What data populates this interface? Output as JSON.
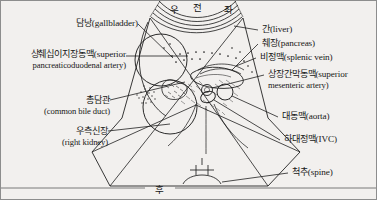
{
  "figure": {
    "background_color": "#f2f0ee",
    "line_color": "#1f1f1f"
  },
  "orientation": {
    "right": "우",
    "anterior": "전",
    "left": "좌",
    "posterior": "후"
  },
  "labels_left": [
    {
      "id": "gallbladder",
      "ko": "담낭(gallbladder)",
      "en": "",
      "lines": 1
    },
    {
      "id": "superior-pancreaticoduodenal-artery",
      "ko": "상췌십이지장동맥(superior",
      "en": "pancreaticoduodenal artery)",
      "lines": 2
    },
    {
      "id": "common-bile-duct",
      "ko": "총담관",
      "en": "(common bile duct)",
      "lines": 2
    },
    {
      "id": "right-kidney",
      "ko": "우측신장",
      "en": "(right kidney)",
      "lines": 2
    }
  ],
  "labels_right": [
    {
      "id": "liver",
      "ko": "간(liver)",
      "en": "",
      "lines": 1
    },
    {
      "id": "pancreas",
      "ko": "췌장(pancreas)",
      "en": "",
      "lines": 1
    },
    {
      "id": "splenic-vein",
      "ko": "비정맥(splenic vein)",
      "en": "",
      "lines": 1
    },
    {
      "id": "superior-mesenteric-artery",
      "ko": "상장간막동맥(superior",
      "en": "mesenteric artery)",
      "lines": 2
    },
    {
      "id": "aorta",
      "ko": "대동맥(aorta)",
      "en": "",
      "lines": 1
    },
    {
      "id": "inferior-vena-cava",
      "ko": "하대정맥(IVC)",
      "en": "",
      "lines": 1
    },
    {
      "id": "spine",
      "ko": "척추(spine)",
      "en": "",
      "lines": 1
    }
  ]
}
